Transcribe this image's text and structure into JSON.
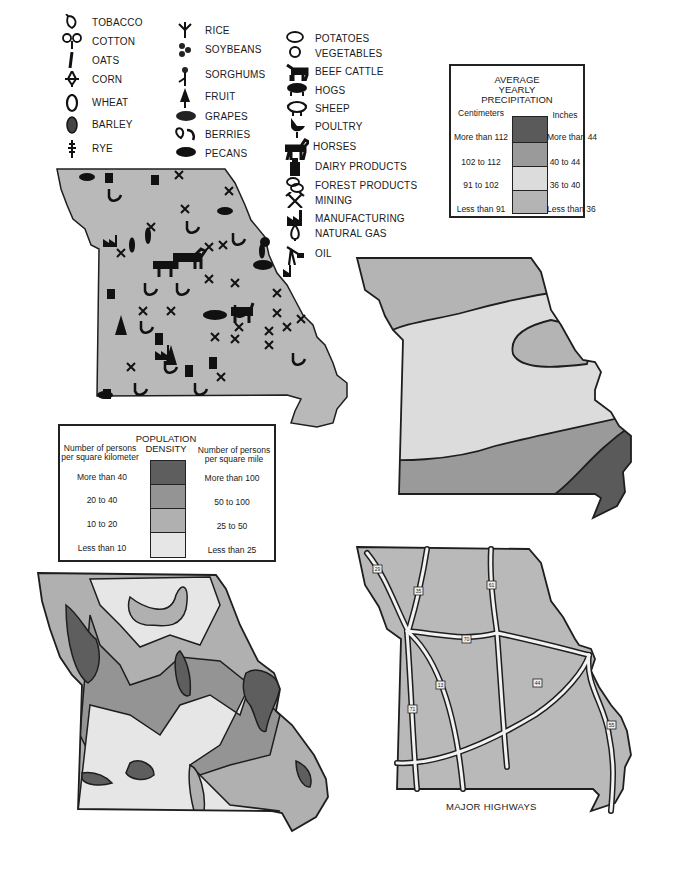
{
  "products_legend": {
    "column1": [
      {
        "label": "TOBACCO",
        "icon": "tobacco-leaf-icon"
      },
      {
        "label": "COTTON",
        "icon": "cotton-boll-icon"
      },
      {
        "label": "OATS",
        "icon": "oats-icon"
      },
      {
        "label": "CORN",
        "icon": "corn-icon"
      },
      {
        "label": "WHEAT",
        "icon": "wheat-icon"
      },
      {
        "label": "BARLEY",
        "icon": "barley-icon"
      },
      {
        "label": "RYE",
        "icon": "rye-icon"
      }
    ],
    "column2": [
      {
        "label": "RICE",
        "icon": "rice-icon"
      },
      {
        "label": "SOYBEANS",
        "icon": "soybeans-icon"
      },
      {
        "label": "SORGHUMS",
        "icon": "sorghum-icon"
      },
      {
        "label": "FRUIT",
        "icon": "fruit-tree-icon"
      },
      {
        "label": "GRAPES",
        "icon": "grapes-icon"
      },
      {
        "label": "BERRIES",
        "icon": "berries-icon"
      },
      {
        "label": "PECANS",
        "icon": "pecan-icon"
      }
    ],
    "column3": [
      {
        "label": "POTATOES",
        "icon": "potato-icon"
      },
      {
        "label": "VEGETABLES",
        "icon": "vegetable-icon"
      },
      {
        "label": "BEEF CATTLE",
        "icon": "cattle-icon"
      },
      {
        "label": "HOGS",
        "icon": "hog-icon"
      },
      {
        "label": "SHEEP",
        "icon": "sheep-icon"
      },
      {
        "label": "POULTRY",
        "icon": "poultry-icon"
      },
      {
        "label": "HORSES",
        "icon": "horse-icon"
      },
      {
        "label": "DAIRY PRODUCTS",
        "icon": "milk-can-icon"
      },
      {
        "label": "FOREST PRODUCTS",
        "icon": "logs-icon"
      },
      {
        "label": "MINING",
        "icon": "pickaxes-icon"
      },
      {
        "label": "MANUFACTURING",
        "icon": "factory-icon"
      },
      {
        "label": "NATURAL GAS",
        "icon": "gas-flame-icon"
      },
      {
        "label": "OIL",
        "icon": "oil-derrick-icon"
      }
    ]
  },
  "precipitation_legend": {
    "title_lines": [
      "AVERAGE",
      "YEARLY",
      "PRECIPITATION"
    ],
    "left_header": "Centimeters",
    "right_header": "Inches",
    "rows": [
      {
        "cm": "More than 112",
        "in": "More than 44",
        "color": "#5a5a5a"
      },
      {
        "cm": "102 to 112",
        "in": "40 to 44",
        "color": "#9a9a9a"
      },
      {
        "cm": "91 to 102",
        "in": "36 to 40",
        "color": "#dcdcdc"
      },
      {
        "cm": "Less than 91",
        "in": "Less than 36",
        "color": "#b4b4b4"
      }
    ]
  },
  "population_legend": {
    "title_lines": [
      "POPULATION",
      "DENSITY"
    ],
    "left_header": [
      "Number of persons",
      "per square kilometer"
    ],
    "right_header": [
      "Number of persons",
      "per square mile"
    ],
    "rows": [
      {
        "km": "More than 40",
        "mi": "More than 100",
        "color": "#5e5e5e"
      },
      {
        "km": "20 to 40",
        "mi": "50 to 100",
        "color": "#949494"
      },
      {
        "km": "10 to 20",
        "mi": "25 to 50",
        "color": "#b0b0b0"
      },
      {
        "km": "Less than 10",
        "mi": "Less than 25",
        "color": "#e6e6e6"
      }
    ]
  },
  "highways_map": {
    "caption": "MAJOR HIGHWAYS",
    "shields": [
      "29",
      "35",
      "61",
      "70",
      "13",
      "71",
      "44",
      "55"
    ]
  },
  "colors": {
    "state_fill": "#b9b9b9",
    "outline": "#1e1e1e",
    "road": "#f2f2f2"
  }
}
